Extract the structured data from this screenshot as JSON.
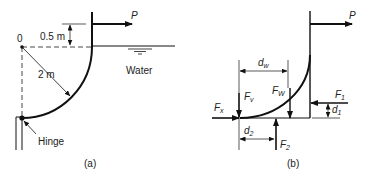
{
  "figure_a": {
    "caption": "(a)",
    "point_label": "0",
    "depth_label": "0.5 m",
    "radius_label": "2 m",
    "fluid_label": "Water",
    "hinge_label": "Hinge",
    "force_label": "P"
  },
  "figure_b": {
    "caption": "(b)",
    "force_P": "P",
    "force_Fx": "F",
    "force_Fx_sub": "x",
    "force_Fv": "F",
    "force_Fv_sub": "v",
    "force_Fw": "F",
    "force_Fw_sub": "W",
    "force_F1": "F",
    "force_F1_sub": "1",
    "force_F2": "F",
    "force_F2_sub": "2",
    "dim_dw": "d",
    "dim_dw_sub": "w",
    "dim_d1": "d",
    "dim_d1_sub": "1",
    "dim_d2": "d",
    "dim_d2_sub": "2"
  },
  "colors": {
    "line": "#111111",
    "text": "#222222",
    "background": "#ffffff"
  }
}
